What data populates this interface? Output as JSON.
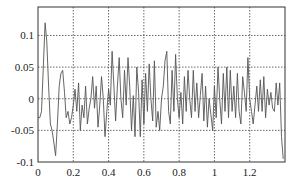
{
  "chart_data": {
    "type": "line",
    "title": "",
    "xlabel": "",
    "ylabel": "",
    "xlim": [
      0,
      1.4
    ],
    "ylim": [
      -0.1,
      0.145
    ],
    "grid": true,
    "legend": null,
    "x_ticks": [
      0,
      0.2,
      0.4,
      0.6,
      0.8,
      1,
      1.2
    ],
    "x_tick_labels": [
      "0",
      "0.2",
      "0.4",
      "0.6",
      "0.8",
      "1",
      "1.2"
    ],
    "y_ticks": [
      -0.1,
      -0.05,
      0,
      0.05,
      0.1
    ],
    "y_tick_labels": [
      "-0.1",
      "-0.05",
      "0",
      "0.05",
      "0.1"
    ],
    "series": [
      {
        "name": "signal",
        "color": "#555555",
        "x": [
          0,
          0.01,
          0.02,
          0.03,
          0.04,
          0.05,
          0.06,
          0.07,
          0.08,
          0.09,
          0.1,
          0.11,
          0.12,
          0.13,
          0.14,
          0.15,
          0.16,
          0.17,
          0.18,
          0.19,
          0.2,
          0.21,
          0.22,
          0.23,
          0.24,
          0.25,
          0.26,
          0.27,
          0.28,
          0.29,
          0.3,
          0.31,
          0.32,
          0.33,
          0.34,
          0.35,
          0.36,
          0.37,
          0.38,
          0.39,
          0.4,
          0.41,
          0.42,
          0.43,
          0.44,
          0.45,
          0.46,
          0.47,
          0.48,
          0.49,
          0.5,
          0.51,
          0.52,
          0.53,
          0.54,
          0.55,
          0.56,
          0.57,
          0.58,
          0.59,
          0.6,
          0.61,
          0.62,
          0.63,
          0.64,
          0.65,
          0.66,
          0.67,
          0.68,
          0.69,
          0.7,
          0.71,
          0.72,
          0.73,
          0.74,
          0.75,
          0.76,
          0.77,
          0.78,
          0.79,
          0.8,
          0.81,
          0.82,
          0.83,
          0.84,
          0.85,
          0.86,
          0.87,
          0.88,
          0.89,
          0.9,
          0.91,
          0.92,
          0.93,
          0.94,
          0.95,
          0.96,
          0.97,
          0.98,
          0.99,
          1.0,
          1.01,
          1.02,
          1.03,
          1.04,
          1.05,
          1.06,
          1.07,
          1.08,
          1.09,
          1.1,
          1.11,
          1.12,
          1.13,
          1.14,
          1.15,
          1.16,
          1.17,
          1.18,
          1.19,
          1.2,
          1.21,
          1.22,
          1.23,
          1.24,
          1.25,
          1.26,
          1.27,
          1.28,
          1.29,
          1.3,
          1.31,
          1.32,
          1.33,
          1.34,
          1.35,
          1.36,
          1.37,
          1.38,
          1.39
        ],
        "y": [
          -0.03,
          -0.03,
          -0.02,
          0.05,
          0.12,
          0.09,
          0.02,
          -0.04,
          -0.05,
          -0.07,
          -0.09,
          -0.04,
          0.02,
          0.04,
          0.045,
          0.01,
          -0.03,
          -0.02,
          -0.04,
          -0.03,
          -0.01,
          0.015,
          -0.02,
          0.025,
          -0.05,
          -0.01,
          -0.03,
          0.02,
          -0.04,
          -0.015,
          0.0,
          0.035,
          -0.015,
          0.02,
          -0.045,
          -0.01,
          0.035,
          0.0,
          -0.06,
          -0.02,
          0.015,
          -0.01,
          0.075,
          0.02,
          -0.035,
          0.02,
          0.065,
          0.0,
          -0.03,
          0.045,
          -0.01,
          0.065,
          0.02,
          -0.05,
          0.005,
          -0.06,
          0.05,
          0.01,
          -0.06,
          0.03,
          -0.04,
          0.04,
          -0.02,
          0.055,
          0.0,
          -0.035,
          0.06,
          -0.045,
          -0.02,
          -0.05,
          0.0,
          0.02,
          0.06,
          0.075,
          -0.02,
          -0.04,
          0.045,
          -0.02,
          0.07,
          0.0,
          -0.03,
          0.01,
          -0.04,
          0.035,
          -0.02,
          0.045,
          0.0,
          -0.03,
          0.045,
          -0.02,
          0.025,
          -0.03,
          0.005,
          0.04,
          -0.035,
          0.02,
          -0.045,
          0.0,
          -0.025,
          -0.05,
          0.02,
          -0.03,
          0.05,
          0.0,
          -0.04,
          0.04,
          -0.02,
          0.05,
          -0.03,
          0.045,
          -0.02,
          0.02,
          -0.03,
          0.04,
          -0.02,
          -0.04,
          0.035,
          0.01,
          -0.02,
          0.065,
          0.0,
          -0.02,
          -0.04,
          -0.01,
          0.02,
          -0.02,
          0.03,
          -0.02,
          0.035,
          -0.03,
          0.015,
          -0.01,
          0.01,
          -0.015,
          -0.02,
          0.025,
          -0.01,
          0.025,
          -0.06,
          -0.095
        ]
      }
    ]
  }
}
